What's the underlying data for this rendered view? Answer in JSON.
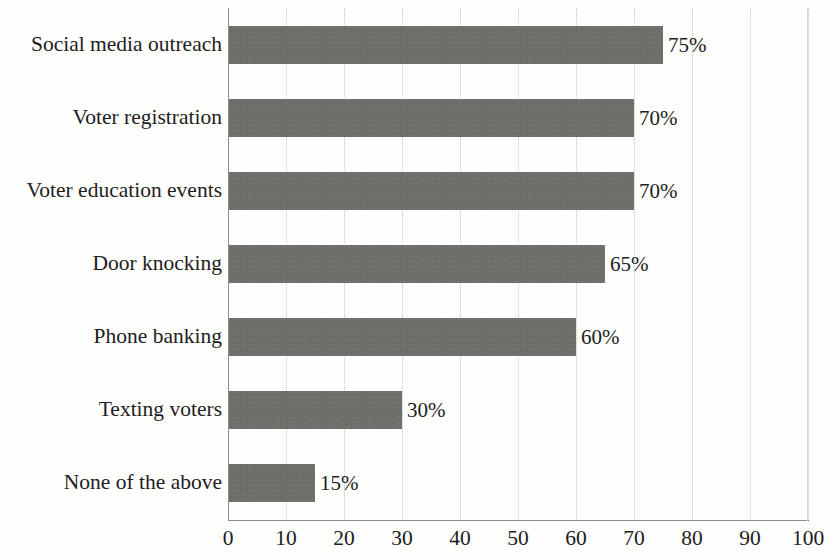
{
  "chart_data": {
    "type": "bar",
    "orientation": "horizontal",
    "title": "",
    "subtitle": "",
    "xlabel": "",
    "ylabel": "",
    "categories": [
      "Social media outreach",
      "Voter registration",
      "Voter education events",
      "Door knocking",
      "Phone banking",
      "Texting voters",
      "None of the above"
    ],
    "values": [
      75,
      70,
      70,
      65,
      60,
      30,
      15
    ],
    "value_labels": [
      "75%",
      "70%",
      "70%",
      "65%",
      "60%",
      "30%",
      "15%"
    ],
    "xlim": [
      0,
      100
    ],
    "xticks": [
      0,
      10,
      20,
      30,
      40,
      50,
      60,
      70,
      80,
      90,
      100
    ],
    "xtick_labels": [
      "0",
      "10",
      "20",
      "30",
      "40",
      "50",
      "60",
      "70",
      "80",
      "90",
      "100"
    ],
    "grid": true,
    "grid_axis": "x",
    "grid_style": "dotted",
    "legend": false,
    "legend_position": "none",
    "bar_color": "#6e6e6a",
    "background_color": "#fefefd",
    "axis_color": "#8d8d88",
    "grid_color": "#c9c9c4",
    "text_color": "#1d1d1d"
  }
}
